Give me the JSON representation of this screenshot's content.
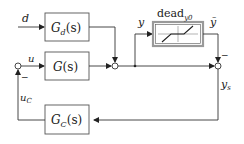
{
  "diagram": {
    "blocks": {
      "gd": {
        "label": "G",
        "sub": "d",
        "arg": "(s)"
      },
      "g": {
        "label": "G",
        "sub": "",
        "arg": "(s)"
      },
      "gc": {
        "label": "G",
        "sub": "C",
        "arg": "(s)"
      },
      "dead": {
        "label": "dead",
        "sub": "y0"
      }
    },
    "signals": {
      "d": "d",
      "u": "u",
      "y": "y",
      "ytilde": "ỹ",
      "ys": "y",
      "ys_sub": "s",
      "uc": "u",
      "uc_sub": "C",
      "minus_sign_1": "−",
      "minus_sign_2": "−"
    },
    "colors": {
      "line": "#333333",
      "block_border": "#555555",
      "dead_border": "#999999"
    }
  }
}
